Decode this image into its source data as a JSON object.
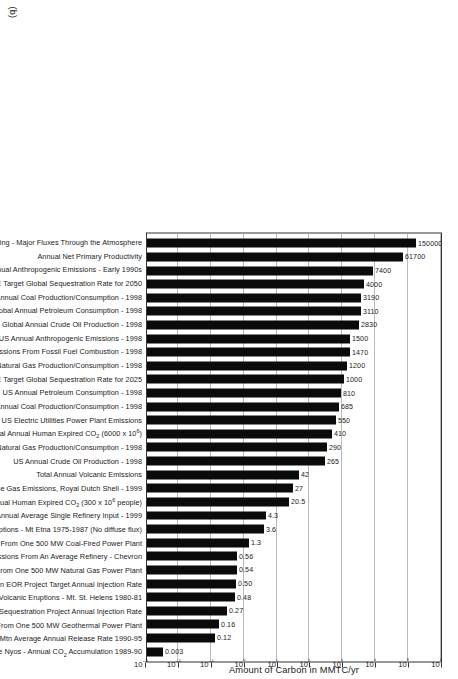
{
  "figure": {
    "panel_tag": "(b)",
    "axis_title": "Amount of Carbon in MMTC/yr"
  },
  "chart_data": {
    "type": "bar",
    "title": "",
    "subtitle": "",
    "orientation": "vertical-bars-rotated-90",
    "xlabel": "",
    "ylabel": "Amount of Carbon in MMTC/yr",
    "yscale": "log",
    "ylim": [
      0.001,
      1000000
    ],
    "grid": true,
    "legend": null,
    "tick_labels": [
      "10⁻³",
      "10⁻²",
      "10⁻¹",
      "10⁰",
      "10¹",
      "10²",
      "10³",
      "10⁴",
      "10⁵",
      "10⁶"
    ],
    "tick_values": [
      0.001,
      0.01,
      0.1,
      1,
      10,
      100,
      1000,
      10000,
      100000,
      1000000
    ],
    "categories": [
      "Annual Carbon Cycling - Major Fluxes Through the Atmosphere",
      "Annual Net Primary Productivity",
      "Global Average Annual Anthropogenic Emissions - Early 1990s",
      "US DOE Target Global Sequestration Rate for 2050",
      "Global Annual Coal Production/Consumption - 1998",
      "Global Annual Petroleum Consumption - 1998",
      "Global Annual Crude Oil Production - 1998",
      "US Annual Anthropogenic Emissions - 1998",
      "US Annual Emissions From Fossil Fuel Combustion - 1998",
      "Global Annual Natural Gas Production/Consumption - 1998",
      "US DOE Target Global Sequestration Rate for 2025",
      "US Annual Petroleum Consumption - 1998",
      "US Annual Coal Production/Consumption - 1998",
      "Total Annual US Electric Utilities Power Plant Emissions",
      "Total Global Annual Human Expired CO<sub>2</sub> (6000 x 10<sup>6</sup>)",
      "US Annual Natural Gas Production/Consumption - 1998",
      "US Annual Crude Oil Production - 1998",
      "Total Annual Volcanic Emissions",
      "Total Annual Greenhouse Gas Emissions, Royal Dutch Shell - 1999",
      "Total US Annual Human Expired CO<sub>2</sub> (300 x 10<sup>6</sup> people)",
      "US Annual Average Single Refinery Input - 1999",
      "Active Volcanic Eruptions - Mt Etna 1975-1987 (No diffuse flux)",
      "Annual Emissions From One 500 MW Coal-Fired Power Plant",
      "Annual Emissions From An Average Refinery - Chevron",
      "Annual Emissions From One 500 MW Natural Gas Power Plant",
      "Weyburn EOR Project Target Annual Injection Rate",
      "Active Volcanic Eruptions - Mt. St. Helens 1980-81",
      "Sleipner West Pilot Sequestration Project Annual Injection Rate",
      "Annual Emissions From One 500 MW Geothermal Power Plant",
      "Mammoth Mtn Average Annual Release Rate 1990-95",
      "Lake Nyos - Annual CO<sub>2</sub> Accumulation 1989-90"
    ],
    "values": [
      150000,
      61700,
      7400,
      4000,
      3190,
      3110,
      2830,
      1500,
      1470,
      1200,
      1000,
      810,
      685,
      550,
      410,
      290,
      265,
      42,
      27,
      20.5,
      4.3,
      3.6,
      1.3,
      0.56,
      0.54,
      0.5,
      0.48,
      0.27,
      0.16,
      0.12,
      0.003
    ],
    "value_labels": [
      "150000",
      "61700",
      "7400",
      "4000",
      "3190",
      "3110",
      "2830",
      "1500",
      "1470",
      "1200",
      "1000",
      "810",
      "685",
      "550",
      "410",
      "290",
      "265",
      "42",
      "27",
      "20.5",
      "4.3",
      "3.6",
      "1.3",
      "0.56",
      "0.54",
      "0.50",
      "0.48",
      "0.27",
      "0.16",
      "0.12",
      "0.003"
    ],
    "colors": {
      "bar": "#0b0b0b",
      "grid": "#b9b9b9",
      "axis": "#333333",
      "text": "#1a1a1a",
      "background": "#ffffff"
    }
  }
}
